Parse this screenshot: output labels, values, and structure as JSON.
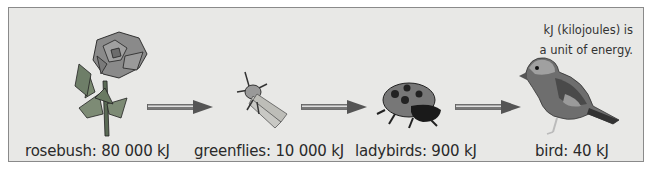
{
  "food_chain": {
    "organisms": [
      {
        "name": "rosebush",
        "label": "rosebush: 80 000 kJ",
        "energy_kj": 80000
      },
      {
        "name": "greenflies",
        "label": "greenflies: 10 000 kJ",
        "energy_kj": 10000
      },
      {
        "name": "ladybirds",
        "label": "ladybirds: 900 kJ",
        "energy_kj": 900
      },
      {
        "name": "bird",
        "label": "bird: 40 kJ",
        "energy_kj": 40
      }
    ],
    "note_line1": "kJ (kilojoules) is",
    "note_line2": "a unit of energy."
  },
  "colors": {
    "panel_bg": "#e8e8e6",
    "border": "#8a8a8a",
    "arrow": "#555555"
  }
}
